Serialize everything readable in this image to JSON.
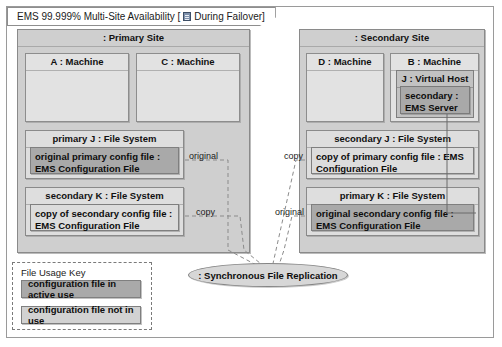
{
  "frame": {
    "title_text_before": "EMS 99.999% Multi-Site Availability [",
    "icon": "note-icon",
    "title_text_after": "During Failover]",
    "full_title": "EMS 99.999% Multi-Site Availability [ During Failover]"
  },
  "primary_site": {
    "label": ": Primary Site",
    "machines": [
      {
        "label": "A : Machine"
      },
      {
        "label": "C : Machine"
      }
    ],
    "file_systems": [
      {
        "label": "primary J : File System",
        "artifact": {
          "label": "original primary config file : EMS Configuration File",
          "state": "active"
        }
      },
      {
        "label": "secondary K : File System",
        "artifact": {
          "label": "copy of secondary config file : EMS Configuration File",
          "state": "inactive"
        }
      }
    ]
  },
  "secondary_site": {
    "label": ": Secondary Site",
    "machines": [
      {
        "label": "D : Machine"
      },
      {
        "label": "B : Machine",
        "virtual_host": {
          "label": "J : Virtual Host",
          "component": {
            "label": "secondary : EMS Server",
            "state": "active"
          }
        }
      }
    ],
    "file_systems": [
      {
        "label": "secondary J : File System",
        "artifact": {
          "label": "copy of primary config file : EMS Configuration File",
          "state": "inactive"
        }
      },
      {
        "label": "primary K : File System",
        "artifact": {
          "label": "original secondary config file : EMS Configuration File",
          "state": "active"
        }
      }
    ]
  },
  "replication": {
    "label": ": Synchronous File Replication"
  },
  "edge_labels": {
    "primary_j_out": "original",
    "primary_k_out": "copy",
    "secondary_j_in": "copy",
    "secondary_k_in": "original"
  },
  "legend": {
    "title": "File Usage Key",
    "items": [
      {
        "label": "configuration file in active use",
        "state": "active"
      },
      {
        "label": "configuration file not in use",
        "state": "inactive"
      }
    ]
  },
  "colors": {
    "active_fill": "#a9a9a9",
    "inactive_fill": "#dcdcdc",
    "site_fill": "#cfcfcf",
    "machine_fill": "#e2e2e2",
    "fs_fill": "#dedede",
    "vhost_fill": "#c2c2c2",
    "ellipse_fill": "#d7d7d7",
    "stroke": "#8a8a8a",
    "page_background": "#ffffff"
  }
}
